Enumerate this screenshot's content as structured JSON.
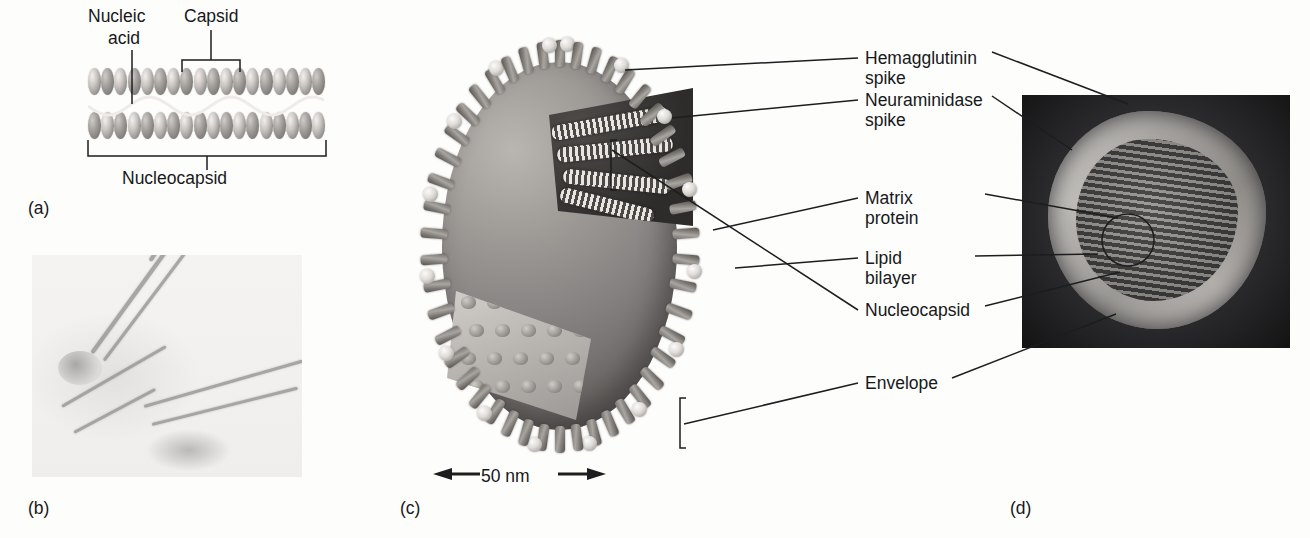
{
  "figure": {
    "kind": "virus-structure-figure",
    "panels": [
      {
        "id": "a",
        "letter": "(a)",
        "caption": "helical nucleocapsid diagram"
      },
      {
        "id": "b",
        "letter": "(b)",
        "caption": "electron micrograph of helical nucleocapsids"
      },
      {
        "id": "c",
        "letter": "(c)",
        "caption": "cutaway diagram of enveloped influenza virion"
      },
      {
        "id": "d",
        "letter": "(d)",
        "caption": "electron micrograph cross-section of virion"
      }
    ]
  },
  "panel_a": {
    "labels": {
      "nucleic_acid_line1": "Nucleic",
      "nucleic_acid_line2": "acid",
      "capsid": "Capsid",
      "nucleocapsid": "Nucleocapsid"
    }
  },
  "panel_c": {
    "scale_bar": "50 nm",
    "labels": {
      "hemagglutinin_line1": "Hemagglutinin",
      "hemagglutinin_line2": "spike",
      "neuraminidase_line1": "Neuraminidase",
      "neuraminidase_line2": "spike",
      "matrix_line1": "Matrix",
      "matrix_line2": "protein",
      "lipid_line1": "Lipid",
      "lipid_line2": "bilayer",
      "nucleocapsid": "Nucleocapsid",
      "envelope": "Envelope"
    }
  },
  "colors": {
    "page_background": "#fdfdfc",
    "text": "#17181a",
    "leader_line": "#1c1d1f",
    "micrograph_dark": "#1b1b1d",
    "micrograph_light": "#efeeec"
  }
}
